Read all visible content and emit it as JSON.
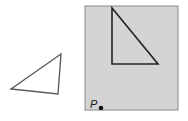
{
  "diagram": {
    "left_triangle": {
      "points": "11,89 61,54 58,94",
      "stroke": "#555555"
    },
    "panel": {
      "fill": "#d4d4d4",
      "stroke": "#888888",
      "x": 85,
      "y": 6,
      "width": 93,
      "height": 104
    },
    "panel_triangle": {
      "points": "112,8 112,64 158,64",
      "stroke": "#222222"
    },
    "point": {
      "label": "P",
      "cx": 101,
      "cy": 108,
      "color": "#111111"
    }
  }
}
